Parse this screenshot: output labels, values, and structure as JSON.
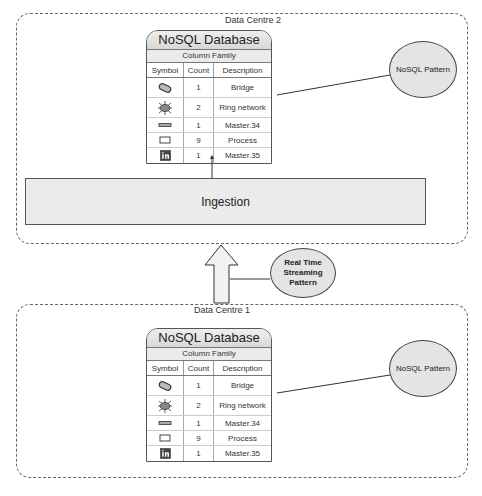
{
  "data_centre_2": {
    "label": "Data Centre 2",
    "database": {
      "title": "NoSQL Database",
      "subtitle": "Column Family",
      "columns": [
        "Symbol",
        "Count",
        "Description"
      ],
      "rows": [
        {
          "symbol": "bridge-icon",
          "count": "1",
          "description": "Bridge"
        },
        {
          "symbol": "ring-network-icon",
          "count": "2",
          "description": "Ring network"
        },
        {
          "symbol": "master-bar-icon",
          "count": "1",
          "description": "Master.34"
        },
        {
          "symbol": "process-rectangle-icon",
          "count": "9",
          "description": "Process"
        },
        {
          "symbol": "linkedin-icon",
          "count": "1",
          "description": "Master.35"
        }
      ]
    },
    "pattern": "NoSQL Pattern",
    "ingestion": "Ingestion"
  },
  "streaming_pattern": "Real Time Streaming Pattern",
  "streaming_pattern_lines": [
    "Real Time",
    "Streaming",
    "Pattern"
  ],
  "data_centre_1": {
    "label": "Data Centre 1",
    "database": {
      "title": "NoSQL Database",
      "subtitle": "Column Family",
      "columns": [
        "Symbol",
        "Count",
        "Description"
      ],
      "rows": [
        {
          "symbol": "bridge-icon",
          "count": "1",
          "description": "Bridge"
        },
        {
          "symbol": "ring-network-icon",
          "count": "2",
          "description": "Ring network"
        },
        {
          "symbol": "master-bar-icon",
          "count": "1",
          "description": "Master.34"
        },
        {
          "symbol": "process-rectangle-icon",
          "count": "9",
          "description": "Process"
        },
        {
          "symbol": "linkedin-icon",
          "count": "1",
          "description": "Master.35"
        }
      ]
    },
    "pattern": "NoSQL Pattern"
  }
}
